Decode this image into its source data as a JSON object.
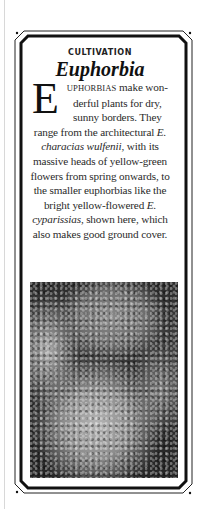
{
  "card": {
    "kicker": "CULTIVATION",
    "title": "Euphorbia",
    "body": {
      "dropcap": "E",
      "lead_smallcaps": "UPHORBIAS",
      "part1": " make won­derful plants for dry, sunny borders. They range from the architectural ",
      "species1": "E. characias wulfenii",
      "part2": ", with its massive heads of yellow-green flowers from spring onwards, to the smaller euphorbias like the bright yellow-flowered ",
      "species2": "E. cyparissias",
      "part3": ", shown here, which also makes good ground cover."
    },
    "photo": {
      "alt": "Euphorbia cyparissias plants growing around a rounded rock"
    }
  },
  "colors": {
    "frame": "#111111",
    "text": "#2a2a2a",
    "background": "#ffffff"
  }
}
